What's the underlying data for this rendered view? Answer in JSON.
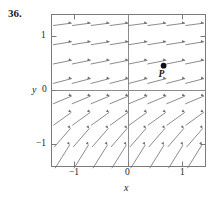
{
  "figure": {
    "exercise_number": "36.",
    "axis_labels": {
      "x": "x",
      "y": "y"
    },
    "x_ticks": [
      {
        "value": -1,
        "label": "−1"
      },
      {
        "value": 0,
        "label": "0"
      },
      {
        "value": 1,
        "label": "1"
      }
    ],
    "y_ticks": [
      {
        "value": 1,
        "label": "1"
      },
      {
        "value": 0,
        "label": "0"
      },
      {
        "value": -1,
        "label": "−1"
      }
    ],
    "point": {
      "label": "P",
      "x": 0.65,
      "y": 0.46
    },
    "colors": {
      "frame": "#7a7a7a",
      "axis": "#8c8c8c",
      "arrow": "#6e6e6e",
      "text": "#1a1a1a",
      "point": "#111111",
      "background": "#ffffff"
    }
  },
  "chart_data": {
    "type": "scatter",
    "title": "",
    "xlabel": "x",
    "ylabel": "y",
    "xlim": [
      -1.4,
      1.4
    ],
    "ylim": [
      -1.4,
      1.4
    ],
    "grid": false,
    "legend": null,
    "xticks": [
      -1,
      0,
      1
    ],
    "yticks": [
      -1,
      0,
      1
    ],
    "sample_x": [
      -1.225,
      -0.875,
      -0.525,
      -0.175,
      0.175,
      0.525,
      0.875,
      1.225
    ],
    "sample_y": [
      1.225,
      0.875,
      0.525,
      0.175,
      -0.175,
      -0.525,
      -0.875,
      -1.225
    ],
    "slopes_by_row_y": [
      {
        "y": 1.225,
        "slope": 0.13
      },
      {
        "y": 0.875,
        "slope": 0.16
      },
      {
        "y": 0.525,
        "slope": 0.2
      },
      {
        "y": 0.175,
        "slope": 0.26
      },
      {
        "y": -0.175,
        "slope": 0.42
      },
      {
        "y": -0.525,
        "slope": 0.72
      },
      {
        "y": -0.875,
        "slope": 1.15
      },
      {
        "y": -1.225,
        "slope": 1.6
      }
    ],
    "points": [
      {
        "label": "P",
        "x": 0.65,
        "y": 0.46
      }
    ],
    "annotations": [
      {
        "text": "36.",
        "x": -1.95,
        "y": 1.55
      }
    ]
  }
}
